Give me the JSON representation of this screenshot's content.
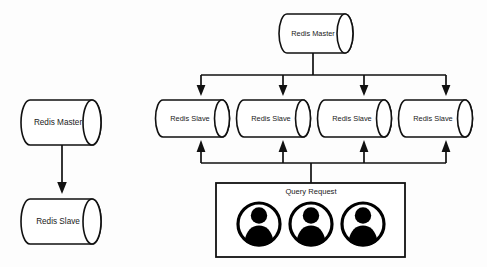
{
  "diagram": {
    "background_color": "#fdfdfd",
    "stroke_color": "#111111",
    "text_color": "#1a1a1a"
  },
  "left_topology": {
    "name": "single-slave-replication",
    "master": {
      "label": "Redis Master"
    },
    "slave": {
      "label": "Redis Slave"
    },
    "arrow": {
      "direction": "down",
      "from": "master",
      "to": "slave"
    }
  },
  "right_topology": {
    "name": "multi-slave-replication-with-query-routing",
    "master": {
      "label": "Redis Master"
    },
    "slaves": [
      {
        "label": "Redis Slave"
      },
      {
        "label": "Redis Slave"
      },
      {
        "label": "Redis Slave"
      },
      {
        "label": "Redis Slave"
      }
    ],
    "replication_arrows": {
      "direction": "down",
      "count": 4
    },
    "query_arrows": {
      "direction": "up",
      "count": 4
    },
    "query_box": {
      "title": "Query Request",
      "clients": [
        {
          "icon": "user-avatar-icon"
        },
        {
          "icon": "user-avatar-icon"
        },
        {
          "icon": "user-avatar-icon"
        }
      ]
    }
  }
}
